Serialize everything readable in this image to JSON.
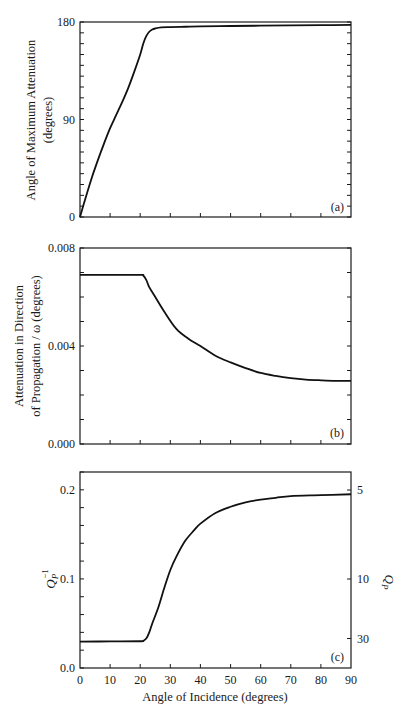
{
  "figure": {
    "x_axis_label": "Angle of Incidence (degrees)",
    "x_ticks": [
      "0",
      "10",
      "20",
      "30",
      "40",
      "50",
      "60",
      "70",
      "80",
      "90"
    ]
  },
  "panels": {
    "a": {
      "tag": "(a)",
      "ylabel_line1": "Angle of Maximum Attenuation",
      "ylabel_line2": "(degrees)",
      "y_ticks": [
        "0",
        "90",
        "180"
      ]
    },
    "b": {
      "tag": "(b)",
      "ylabel_line1": "Attenuation in Direction",
      "ylabel_line2": "of Propagation / ω (degrees)",
      "y_ticks": [
        "0.000",
        "0.004",
        "0.008"
      ]
    },
    "c": {
      "tag": "(c)",
      "ylabel_left": "Q",
      "ylabel_left_sub": "P",
      "ylabel_left_sup": "−1",
      "ylabel_right": "Q",
      "ylabel_right_sub": "P",
      "y_ticks": [
        "0.0",
        "0.1",
        "0.2"
      ],
      "y2_ticks": [
        "5",
        "10",
        "30"
      ]
    }
  },
  "chart_data": [
    {
      "type": "line",
      "panel": "(a)",
      "title": "",
      "xlabel": "Angle of Incidence (degrees)",
      "ylabel": "Angle of Maximum Attenuation (degrees)",
      "xlim": [
        0,
        90
      ],
      "ylim": [
        0,
        180
      ],
      "x_ticks": [
        0,
        10,
        20,
        30,
        40,
        50,
        60,
        70,
        80,
        90
      ],
      "y_ticks": [
        0,
        90,
        180
      ],
      "grid": false,
      "series": [
        {
          "name": "angle of maximum attenuation",
          "x": [
            0,
            2,
            4,
            6,
            8,
            10,
            12,
            14,
            16,
            18,
            20,
            21,
            22,
            23,
            24,
            25,
            27,
            30,
            35,
            40,
            50,
            60,
            70,
            80,
            90
          ],
          "y": [
            0,
            19,
            37,
            53,
            68,
            82,
            94,
            106,
            119,
            134,
            150,
            160,
            167,
            171,
            173,
            174,
            175,
            175.3,
            175.6,
            175.9,
            176.3,
            176.6,
            176.9,
            177.1,
            177.3
          ]
        }
      ]
    },
    {
      "type": "line",
      "panel": "(b)",
      "title": "",
      "xlabel": "Angle of Incidence (degrees)",
      "ylabel": "Attenuation in Direction of Propagation / ω (degrees)",
      "xlim": [
        0,
        90
      ],
      "ylim": [
        0.0,
        0.008
      ],
      "x_ticks": [
        0,
        10,
        20,
        30,
        40,
        50,
        60,
        70,
        80,
        90
      ],
      "y_ticks": [
        0.0,
        0.004,
        0.008
      ],
      "grid": false,
      "series": [
        {
          "name": "attenuation / omega",
          "x": [
            0,
            10,
            20,
            21,
            22,
            23,
            25,
            28,
            32,
            36,
            40,
            45,
            50,
            55,
            60,
            65,
            70,
            75,
            80,
            85,
            90
          ],
          "y": [
            0.0069,
            0.0069,
            0.0069,
            0.00688,
            0.0067,
            0.0064,
            0.006,
            0.0054,
            0.0047,
            0.0043,
            0.004,
            0.0036,
            0.00333,
            0.0031,
            0.0029,
            0.00278,
            0.00269,
            0.00263,
            0.0026,
            0.00258,
            0.00258
          ]
        }
      ]
    },
    {
      "type": "line",
      "panel": "(c)",
      "title": "",
      "xlabel": "Angle of Incidence (degrees)",
      "ylabel": "Q_P^-1",
      "y2label": "Q_P",
      "xlim": [
        0,
        90
      ],
      "ylim": [
        0.0,
        0.22
      ],
      "x_ticks": [
        0,
        10,
        20,
        30,
        40,
        50,
        60,
        70,
        80,
        90
      ],
      "y_ticks": [
        0.0,
        0.1,
        0.2
      ],
      "y2_ticks": [
        5,
        10,
        30
      ],
      "grid": false,
      "series": [
        {
          "name": "Q_P^-1",
          "x": [
            0,
            10,
            20,
            21,
            22,
            23,
            24,
            26,
            28,
            30,
            32,
            35,
            38,
            40,
            45,
            50,
            55,
            60,
            65,
            70,
            80,
            90
          ],
          "y": [
            0.0296,
            0.0298,
            0.03,
            0.0305,
            0.033,
            0.04,
            0.05,
            0.068,
            0.09,
            0.11,
            0.125,
            0.143,
            0.155,
            0.162,
            0.174,
            0.181,
            0.186,
            0.189,
            0.191,
            0.193,
            0.194,
            0.195
          ]
        }
      ]
    }
  ]
}
